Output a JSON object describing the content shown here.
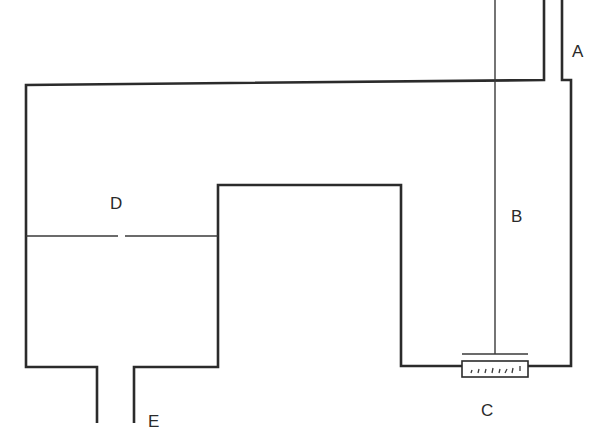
{
  "diagram": {
    "type": "apparatus-schematic",
    "labels": {
      "A": "A",
      "B": "B",
      "C": "C",
      "D": "D",
      "E": "E"
    },
    "parts": [
      {
        "id": "A",
        "description": "inlet tube at top right"
      },
      {
        "id": "B",
        "description": "vertical rod/wire down to C"
      },
      {
        "id": "C",
        "description": "graduated element at bottom of right chamber"
      },
      {
        "id": "D",
        "description": "horizontal partition with small gap in left chamber"
      },
      {
        "id": "E",
        "description": "outlet tube at bottom left"
      }
    ],
    "colors": {
      "line": "#2b2b2b",
      "background": "#ffffff"
    }
  }
}
